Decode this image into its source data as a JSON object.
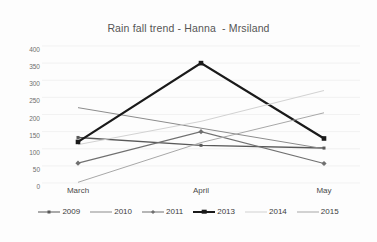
{
  "chart_data": {
    "type": "line",
    "title": "Rain fall trend - Hanna  - Mrsiland",
    "xlabel": "",
    "ylabel": "",
    "categories": [
      "March",
      "April",
      "May"
    ],
    "ylim": [
      0,
      400
    ],
    "yticks": [
      "400",
      "350",
      "300",
      "250",
      "200",
      "150",
      "100",
      "50",
      "0"
    ],
    "grid": true,
    "legend_position": "bottom",
    "series": [
      {
        "name": "2009",
        "values": [
          133,
          110,
          102
        ],
        "color": "#595959",
        "width": 1.4,
        "marker": "square",
        "marker_size": 3
      },
      {
        "name": "2010",
        "values": [
          220,
          160,
          100
        ],
        "color": "#8c8c8c",
        "width": 1.0,
        "marker": "none",
        "marker_size": 0
      },
      {
        "name": "2011",
        "values": [
          58,
          150,
          57
        ],
        "color": "#707070",
        "width": 1.1,
        "marker": "diamond",
        "marker_size": 2.6
      },
      {
        "name": "2013",
        "values": [
          120,
          350,
          130
        ],
        "color": "#1a1a1a",
        "width": 2.2,
        "marker": "square",
        "marker_size": 4.6
      },
      {
        "name": "2014",
        "values": [
          112,
          180,
          270
        ],
        "color": "#d2d2d2",
        "width": 1.0,
        "marker": "none",
        "marker_size": 0
      },
      {
        "name": "2015",
        "values": [
          2,
          118,
          205
        ],
        "color": "#a8a8a8",
        "width": 1.0,
        "marker": "none",
        "marker_size": 0
      }
    ]
  },
  "colors": {
    "plot_background": "#fdfdfd",
    "gridline": "#ededed",
    "title_text": "#555555",
    "tick_text": "#6e6e6e"
  }
}
